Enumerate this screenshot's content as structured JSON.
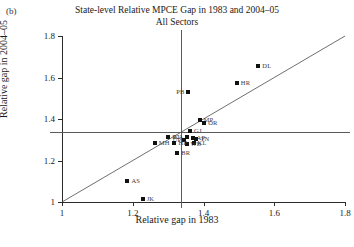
{
  "panel": {
    "letter": "(b)"
  },
  "chart_data": {
    "type": "scatter",
    "title": "State-level Relative MPCE Gap in 1983 and 2004–05",
    "subtitle": "All Sectors",
    "xlabel": "Relative gap in 1983",
    "ylabel": "Relative gap in 2004–05",
    "xlim": [
      1.0,
      1.8
    ],
    "ylim": [
      1.0,
      1.8
    ],
    "xticks": [
      "1",
      "1.2",
      "1.4",
      "1.6",
      "1.8"
    ],
    "xtickvalues": [
      1.0,
      1.2,
      1.4,
      1.6,
      1.8
    ],
    "yticks": [
      "1",
      "1.2",
      "1.4",
      "1.6",
      "1.8"
    ],
    "ytickvalues": [
      1.0,
      1.2,
      1.4,
      1.6,
      1.8
    ],
    "grid": false,
    "legend": "none",
    "reference_lines": {
      "vertical_x": 1.335,
      "horizontal_y": 1.335,
      "diagonal": "y = x"
    },
    "points": [
      {
        "label": "DL",
        "x": 1.555,
        "y": 1.655,
        "label_side": "right"
      },
      {
        "label": "HR",
        "x": 1.494,
        "y": 1.575,
        "label_side": "right"
      },
      {
        "label": "PB",
        "x": 1.355,
        "y": 1.53,
        "label_side": "left"
      },
      {
        "label": "MP",
        "x": 1.389,
        "y": 1.395,
        "label_side": "right"
      },
      {
        "label": "OR",
        "x": 1.402,
        "y": 1.38,
        "label_side": "right"
      },
      {
        "label": "GJ",
        "x": 1.362,
        "y": 1.34,
        "label_side": "right"
      },
      {
        "label": "AP",
        "x": 1.369,
        "y": 1.31,
        "label_side": "right"
      },
      {
        "label": "TN",
        "x": 1.38,
        "y": 1.306,
        "label_side": "right"
      },
      {
        "label": "KA",
        "x": 1.352,
        "y": 1.312,
        "label_side": "left"
      },
      {
        "label": "UP",
        "x": 1.346,
        "y": 1.3,
        "label_side": "left"
      },
      {
        "label": "KL",
        "x": 1.372,
        "y": 1.282,
        "label_side": "right"
      },
      {
        "label": "WB",
        "x": 1.352,
        "y": 1.28,
        "label_side": "right"
      },
      {
        "label": "HP",
        "x": 1.318,
        "y": 1.285,
        "label_side": "right"
      },
      {
        "label": "RJ",
        "x": 1.3,
        "y": 1.312,
        "label_side": "right"
      },
      {
        "label": "MH",
        "x": 1.262,
        "y": 1.285,
        "label_side": "right"
      },
      {
        "label": "BR",
        "x": 1.326,
        "y": 1.238,
        "label_side": "right"
      },
      {
        "label": "AS",
        "x": 1.185,
        "y": 1.1,
        "label_side": "right"
      },
      {
        "label": "JK",
        "x": 1.228,
        "y": 1.015,
        "label_side": "right"
      }
    ]
  }
}
